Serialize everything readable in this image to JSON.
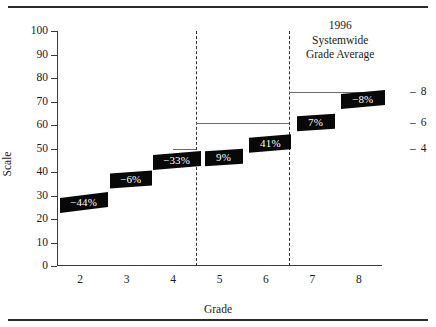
{
  "chart_data": {
    "type": "bar",
    "title": "",
    "xlabel": "Grade",
    "ylabel": "Scale",
    "ylim": [
      0,
      100
    ],
    "xlim": [
      1.5,
      8.5
    ],
    "ytick_labels": [
      "0",
      "10",
      "20",
      "30",
      "40",
      "50",
      "60",
      "70",
      "80",
      "90",
      "100"
    ],
    "ytick_values": [
      0,
      10,
      20,
      30,
      40,
      50,
      60,
      70,
      80,
      90,
      100
    ],
    "xtick_labels": [
      "2",
      "3",
      "4",
      "5",
      "6",
      "7",
      "8"
    ],
    "xtick_values": [
      2,
      3,
      4,
      5,
      6,
      7,
      8
    ],
    "grid": false,
    "legend": "none",
    "annotation_heading": [
      "1996",
      "Systemwide",
      "Grade Average"
    ],
    "right_axis_labels": [
      "8",
      "6",
      "4"
    ],
    "right_axis_values": [
      74,
      61,
      50
    ],
    "dividers": [
      4.5,
      6.5
    ],
    "levels": [
      {
        "name": "elementary",
        "value": 50,
        "x_start": 4.0,
        "x_end": 4.5
      },
      {
        "name": "middle",
        "value": 61,
        "x_start": 4.5,
        "x_end": 6.5
      },
      {
        "name": "high",
        "value": 74,
        "x_start": 6.5,
        "x_end": 8.2
      }
    ],
    "categories": [
      "2",
      "3",
      "4",
      "5",
      "6",
      "7",
      "8"
    ],
    "values": [
      27,
      37,
      47,
      45,
      53,
      64,
      70
    ],
    "labels": [
      {
        "text": "−44%",
        "grade": 2,
        "value": 27
      },
      {
        "text": "−6%",
        "grade": 3,
        "value": 37
      },
      {
        "text": "−33%",
        "grade": 4,
        "value": 45
      },
      {
        "text": "9%",
        "grade": 5,
        "value": 46
      },
      {
        "text": "41%",
        "grade": 6,
        "value": 52
      },
      {
        "text": "7%",
        "grade": 7,
        "value": 61
      },
      {
        "text": "−8%",
        "grade": 8,
        "value": 71
      }
    ],
    "colors": {
      "tag_fill": "#080808",
      "tag_text": "#ffffff",
      "segment": "#6d6d6d",
      "axis": "#3a3a3a",
      "divider": "#2f2f2f",
      "rule": "#2b2b2b"
    }
  }
}
